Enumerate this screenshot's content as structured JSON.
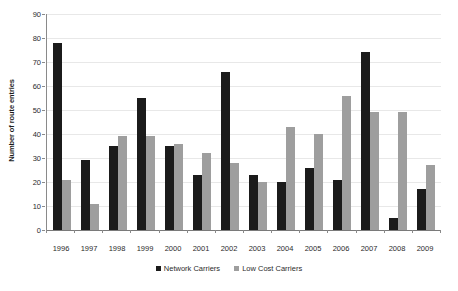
{
  "chart_data": {
    "type": "bar",
    "title": "",
    "xlabel": "",
    "ylabel": "Number of route entries",
    "ylim": [
      0,
      90
    ],
    "yticks": [
      0,
      10,
      20,
      30,
      40,
      50,
      60,
      70,
      80,
      90
    ],
    "grid": true,
    "legend_position": "bottom",
    "categories": [
      "1996",
      "1997",
      "1998",
      "1999",
      "2000",
      "2001",
      "2002",
      "2003",
      "2004",
      "2005",
      "2006",
      "2007",
      "2008",
      "2009"
    ],
    "series": [
      {
        "name": "Network Carriers",
        "color": "#1b1b1b",
        "values": [
          78,
          29,
          35,
          55,
          35,
          23,
          66,
          23,
          20,
          26,
          21,
          74,
          5,
          17
        ]
      },
      {
        "name": "Low Cost Carriers",
        "color": "#9e9e9e",
        "values": [
          21,
          11,
          39,
          39,
          36,
          32,
          28,
          20,
          43,
          40,
          56,
          49,
          49,
          27
        ]
      }
    ]
  },
  "legend": {
    "items": [
      {
        "label": "Network Carriers",
        "swatch": "network-swatch-icon"
      },
      {
        "label": "Low Cost Carriers",
        "swatch": "lowcost-swatch-icon"
      }
    ]
  }
}
